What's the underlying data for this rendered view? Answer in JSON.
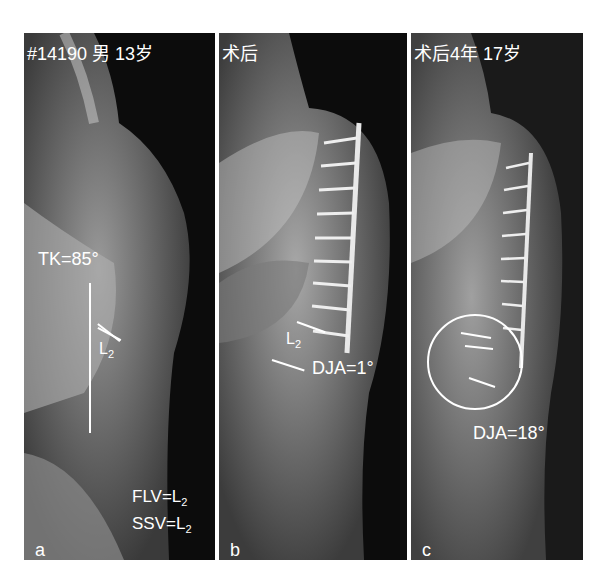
{
  "figure": {
    "panels": [
      {
        "id": "a",
        "letter": "a",
        "header": "#14190  男  13岁",
        "annotations": {
          "tk": "TK=85°",
          "vertebra_label": "L",
          "vertebra_sub": "2",
          "flv_prefix": "FLV=L",
          "flv_sub": "2",
          "ssv_prefix": "SSV=L",
          "ssv_sub": "2"
        }
      },
      {
        "id": "b",
        "letter": "b",
        "header": "术后",
        "annotations": {
          "vertebra_label": "L",
          "vertebra_sub": "2",
          "dja": "DJA=1°"
        }
      },
      {
        "id": "c",
        "letter": "c",
        "header": "术后4年  17岁",
        "annotations": {
          "dja": "DJA=18°"
        }
      }
    ]
  }
}
